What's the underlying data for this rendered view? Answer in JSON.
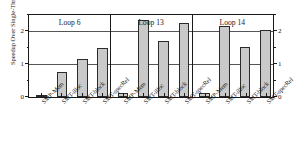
{
  "chart_data": {
    "type": "bar",
    "title": "",
    "xlabel": "",
    "ylabel": "Speedup Over Single-Thread Execution",
    "ylim": [
      0,
      2.5
    ],
    "yticks": [
      0,
      1,
      2
    ],
    "ytick_labels": [
      "0",
      "1",
      "2"
    ],
    "grid": true,
    "grid_axis": "y",
    "legend": "none",
    "dual_axis": true,
    "bar_color": "#c9c9c9",
    "bar_edge_color": "#2b2b2b",
    "categories": [
      "SMP-Mem",
      "SMT-illoc",
      "SMT-block",
      "SMT-specRel"
    ],
    "groups": [
      {
        "name": "Loop 6",
        "categories": [
          "SMP-Mem",
          "SMT-illoc",
          "SMT-block",
          "SMT-specRel"
        ],
        "values": [
          0.07,
          0.75,
          1.15,
          1.48
        ]
      },
      {
        "name": "Loop 13",
        "categories": [
          "SMP-Mem",
          "SMT-illoc",
          "SMT-block",
          "SMT-specRel"
        ],
        "values": [
          0.12,
          2.35,
          1.7,
          2.27
        ]
      },
      {
        "name": "Loop 14",
        "categories": [
          "SMP-Mem",
          "SMT-illoc",
          "SMT-block",
          "SMT-specRel"
        ],
        "values": [
          0.11,
          2.15,
          1.52,
          2.03
        ]
      }
    ]
  },
  "axis": {
    "left_tick_labels": [
      "0",
      "1",
      "2"
    ],
    "right_tick_labels": [
      "0",
      "1",
      "2"
    ],
    "y_axis_title": "Speedup Over Single-Thread Execution"
  },
  "group_titles": [
    "Loop 6",
    "Loop 13",
    "Loop 14"
  ],
  "x_tick_labels": [
    "SMP-Mem",
    "SMT-illoc",
    "SMT-block",
    "SMT-specRel",
    "SMP-Mem",
    "SMT-illoc",
    "SMT-block",
    "SMT-specRel",
    "SMP-Mem",
    "SMT-illoc",
    "SMT-block",
    "SMT-specRel"
  ]
}
